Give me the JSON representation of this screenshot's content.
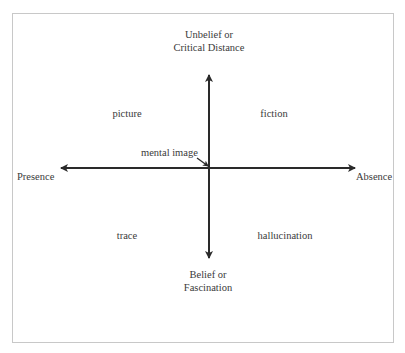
{
  "diagram": {
    "axes": {
      "top": {
        "line1": "Unbelief or",
        "line2": "Critical Distance"
      },
      "bottom": {
        "line1": "Belief or",
        "line2": "Fascination"
      },
      "left": "Presence",
      "right": "Absence"
    },
    "quadrants": {
      "top_left": "picture",
      "top_right": "fiction",
      "bottom_left": "trace",
      "bottom_right": "hallucination"
    },
    "center_annotation": "mental image",
    "colors": {
      "axis": "#2a2a2a",
      "frame": "#c8c8c8",
      "text": "#3a3a3a"
    }
  }
}
